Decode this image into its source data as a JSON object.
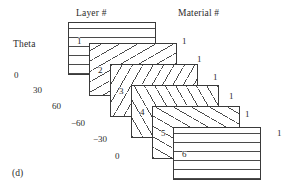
{
  "figure": {
    "caption": "(d)",
    "background_color": "#ffffff",
    "line_color": "#3a3a3a",
    "hatch_color": "#4a4a4a"
  },
  "headers": {
    "layer": "Layer #",
    "material": "Material #"
  },
  "theta": {
    "label": "Theta",
    "values": [
      "0",
      "30",
      "60",
      "−60",
      "−30",
      "0"
    ]
  },
  "layers": [
    {
      "number": "1",
      "theta": "0",
      "material": "1",
      "hatch": "hatch-0",
      "x": 68,
      "y": 22,
      "w": 88,
      "h": 53
    },
    {
      "number": "2",
      "theta": "30",
      "material": "1",
      "hatch": "hatch-30",
      "x": 89,
      "y": 43,
      "w": 88,
      "h": 53
    },
    {
      "number": "3",
      "theta": "60",
      "material": "1",
      "hatch": "hatch-60",
      "x": 110,
      "y": 64,
      "w": 88,
      "h": 53
    },
    {
      "number": "4",
      "theta": "−60",
      "material": "1",
      "hatch": "hatch-n60",
      "x": 131,
      "y": 85,
      "w": 88,
      "h": 53
    },
    {
      "number": "5",
      "theta": "−30",
      "material": "1",
      "hatch": "hatch-n30",
      "x": 152,
      "y": 106,
      "w": 88,
      "h": 53
    },
    {
      "number": "6",
      "theta": "0",
      "material": "1",
      "hatch": "hatch-0",
      "x": 173,
      "y": 127,
      "w": 88,
      "h": 53
    }
  ],
  "theta_positions": [
    {
      "x": 14,
      "y": 70
    },
    {
      "x": 33,
      "y": 85
    },
    {
      "x": 52,
      "y": 101
    },
    {
      "x": 71,
      "y": 118
    },
    {
      "x": 93,
      "y": 134
    },
    {
      "x": 115,
      "y": 151
    }
  ],
  "material_positions": [
    {
      "x": 182,
      "y": 36
    },
    {
      "x": 197,
      "y": 54
    },
    {
      "x": 213,
      "y": 72
    },
    {
      "x": 229,
      "y": 91
    },
    {
      "x": 245,
      "y": 109
    },
    {
      "x": 277,
      "y": 128
    }
  ],
  "layer_number_positions": [
    {
      "x": 8,
      "y": 14
    },
    {
      "x": 8,
      "y": 22
    },
    {
      "x": 8,
      "y": 22
    },
    {
      "x": 8,
      "y": 22
    },
    {
      "x": 8,
      "y": 22
    },
    {
      "x": 8,
      "y": 22
    }
  ]
}
